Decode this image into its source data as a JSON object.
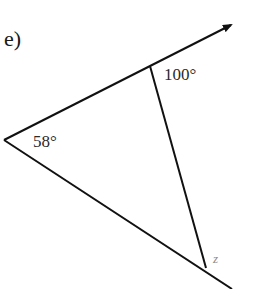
{
  "diagram": {
    "part_label": "e)",
    "angles": {
      "top_exterior": "100°",
      "left_vertex": "58°",
      "unknown": "z"
    },
    "colors": {
      "line": "#111111",
      "text": "#1a1a1a",
      "unknown_label": "#8a8a8a",
      "background": "#ffffff"
    }
  }
}
